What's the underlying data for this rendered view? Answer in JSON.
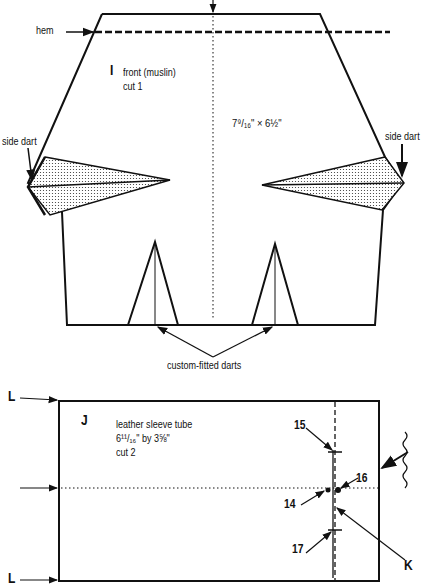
{
  "piece_I": {
    "letter": "I",
    "name": "front (muslin)",
    "cut": "cut 1",
    "dimensions": "7⁹/₁₆\" × 6½\"",
    "labels": {
      "hem": "hem",
      "side_dart_left": "side dart",
      "side_dart_right": "side dart",
      "custom_darts": "custom-fitted darts"
    }
  },
  "piece_J": {
    "letter": "J",
    "name": "leather sleeve tube",
    "dimensions": "6¹¹/₁₆\" by 3⅝\"",
    "cut": "cut 2",
    "markers": {
      "L_top": "L",
      "L_bottom": "L",
      "K": "K",
      "p14": "14",
      "p15": "15",
      "p16": "16",
      "p17": "17"
    }
  },
  "colors": {
    "line": "#111111",
    "background": "#ffffff"
  }
}
